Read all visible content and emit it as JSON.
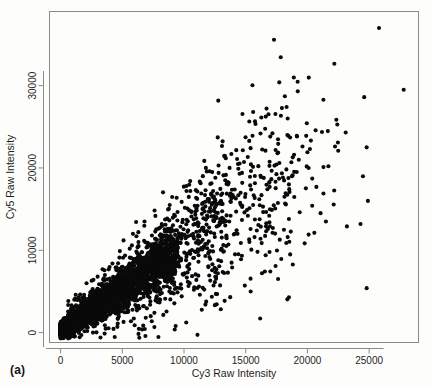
{
  "figure": {
    "panel_label": "(a)",
    "background_color": "#fdfdfb",
    "frame_color": "#8a8a8a",
    "point_color": "#0a0a0a"
  },
  "chart_data": {
    "type": "scatter",
    "title": "",
    "xlabel": "Cy3 Raw Intensity",
    "ylabel": "Cy5 Raw Intensity",
    "xlim": [
      -900,
      29000
    ],
    "ylim": [
      -1200,
      39000
    ],
    "xticks": [
      0,
      5000,
      10000,
      15000,
      20000,
      25000
    ],
    "xtick_labels": [
      "0",
      "5000",
      "10000",
      "15000",
      "20000",
      "25000"
    ],
    "yticks": [
      0,
      10000,
      20000,
      30000
    ],
    "ytick_labels": [
      "0",
      "10000",
      "20000",
      "30000"
    ],
    "grid": false,
    "legend": null,
    "marker": "filled-circle",
    "marker_size_px": 3.0,
    "n_points_approx": 4200,
    "cluster_model": {
      "core": {
        "n": 3000,
        "x_min": 0,
        "x_max": 9500,
        "slope": 1.02,
        "intercept": 250,
        "spread_base": 420,
        "spread_growth": 0.15,
        "x_skew": 2.1
      },
      "midband": {
        "n": 760,
        "x_min": 600,
        "x_max": 13500,
        "slope": 1.0,
        "intercept": 400,
        "spread_base": 900,
        "spread_growth": 0.22,
        "x_skew": 1.55
      },
      "upper_spread": {
        "n": 300,
        "x_min": 6000,
        "x_max": 19000,
        "slope": 1.06,
        "intercept": 300,
        "spread_base": 1500,
        "spread_growth": 0.26,
        "x_skew": 1.15
      },
      "tail": {
        "n": 95,
        "x_min": 12000,
        "x_max": 22500,
        "slope": 1.0,
        "intercept": 900,
        "spread_base": 2300,
        "spread_growth": 0.16,
        "x_skew": 1.0
      }
    },
    "outliers": [
      {
        "x": 25800,
        "y": 37000
      },
      {
        "x": 27800,
        "y": 29500
      },
      {
        "x": 24600,
        "y": 28600
      },
      {
        "x": 15600,
        "y": 26800
      },
      {
        "x": 18400,
        "y": 26000
      },
      {
        "x": 23100,
        "y": 24300
      },
      {
        "x": 19900,
        "y": 23900
      },
      {
        "x": 18600,
        "y": 23700
      },
      {
        "x": 19600,
        "y": 22600
      },
      {
        "x": 20200,
        "y": 22300
      },
      {
        "x": 24800,
        "y": 22500
      },
      {
        "x": 16600,
        "y": 22100
      },
      {
        "x": 20000,
        "y": 21900
      },
      {
        "x": 19300,
        "y": 21000
      },
      {
        "x": 18700,
        "y": 20700
      },
      {
        "x": 12800,
        "y": 20300
      },
      {
        "x": 20100,
        "y": 20000
      },
      {
        "x": 21300,
        "y": 20100
      },
      {
        "x": 21700,
        "y": 20200
      },
      {
        "x": 14400,
        "y": 19900
      },
      {
        "x": 14700,
        "y": 19400
      },
      {
        "x": 14500,
        "y": 19300
      },
      {
        "x": 18800,
        "y": 19100
      },
      {
        "x": 24500,
        "y": 19000
      },
      {
        "x": 17700,
        "y": 18700
      },
      {
        "x": 10500,
        "y": 18400
      },
      {
        "x": 18500,
        "y": 18000
      },
      {
        "x": 16900,
        "y": 18200
      },
      {
        "x": 10200,
        "y": 17200
      },
      {
        "x": 13100,
        "y": 16900
      },
      {
        "x": 13800,
        "y": 16800
      },
      {
        "x": 11700,
        "y": 16700
      },
      {
        "x": 21300,
        "y": 16900
      },
      {
        "x": 14200,
        "y": 16300
      },
      {
        "x": 12500,
        "y": 16200
      },
      {
        "x": 16100,
        "y": 16200
      },
      {
        "x": 24900,
        "y": 16000
      },
      {
        "x": 12300,
        "y": 15700
      },
      {
        "x": 12900,
        "y": 15800
      },
      {
        "x": 15600,
        "y": 15500
      },
      {
        "x": 16400,
        "y": 15300
      },
      {
        "x": 11100,
        "y": 15400
      },
      {
        "x": 11500,
        "y": 15000
      },
      {
        "x": 15300,
        "y": 15100
      },
      {
        "x": 15100,
        "y": 14900
      },
      {
        "x": 14900,
        "y": 14600
      },
      {
        "x": 11900,
        "y": 14000
      },
      {
        "x": 12600,
        "y": 13900
      },
      {
        "x": 13200,
        "y": 13800
      },
      {
        "x": 18500,
        "y": 13800
      },
      {
        "x": 21500,
        "y": 13500
      },
      {
        "x": 24300,
        "y": 13200
      },
      {
        "x": 23200,
        "y": 12900
      },
      {
        "x": 17200,
        "y": 12700
      },
      {
        "x": 15900,
        "y": 12400
      },
      {
        "x": 14100,
        "y": 12000
      },
      {
        "x": 18400,
        "y": 11600
      },
      {
        "x": 16200,
        "y": 11400
      },
      {
        "x": 15300,
        "y": 11000
      },
      {
        "x": 13600,
        "y": 10700
      },
      {
        "x": 18600,
        "y": 9500
      },
      {
        "x": 12300,
        "y": 8300
      },
      {
        "x": 13900,
        "y": 7900
      },
      {
        "x": 12600,
        "y": 6800
      },
      {
        "x": 11000,
        "y": 6400
      },
      {
        "x": 15400,
        "y": 5000
      },
      {
        "x": 24800,
        "y": 5400
      },
      {
        "x": 18500,
        "y": 4300
      },
      {
        "x": 10800,
        "y": 5200
      },
      {
        "x": 7300,
        "y": 2000
      },
      {
        "x": 6900,
        "y": 1800
      },
      {
        "x": 6000,
        "y": 900
      },
      {
        "x": 4600,
        "y": 700
      },
      {
        "x": 5100,
        "y": 1300
      },
      {
        "x": 7600,
        "y": 2400
      },
      {
        "x": 2100,
        "y": 6000
      },
      {
        "x": 2600,
        "y": 5300
      },
      {
        "x": 1900,
        "y": 4600
      },
      {
        "x": 3400,
        "y": 7700
      },
      {
        "x": 4800,
        "y": 9900
      },
      {
        "x": 6300,
        "y": 12200
      },
      {
        "x": 5100,
        "y": 11200
      },
      {
        "x": 6800,
        "y": 13500
      },
      {
        "x": 7400,
        "y": 11800
      },
      {
        "x": 8200,
        "y": 13200
      },
      {
        "x": 9200,
        "y": 14300
      },
      {
        "x": 8700,
        "y": 12600
      },
      {
        "x": 9900,
        "y": 13700
      },
      {
        "x": 10600,
        "y": 14100
      },
      {
        "x": 7900,
        "y": 10600
      },
      {
        "x": 5600,
        "y": 10200
      },
      {
        "x": 4200,
        "y": 8400
      },
      {
        "x": 3000,
        "y": 6800
      }
    ]
  }
}
